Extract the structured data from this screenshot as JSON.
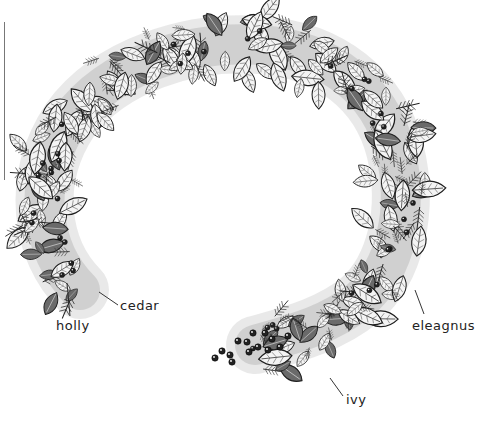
{
  "figure": {
    "style": "pen-and-ink line drawing",
    "stroke_color": "#1e1e1e",
    "background": "#ffffff",
    "labels": [
      {
        "id": "holly",
        "text": "holly",
        "x": 56,
        "y": 322,
        "pointer": {
          "x1": 70,
          "y1": 316,
          "x2": 67,
          "y2": 283
        }
      },
      {
        "id": "cedar",
        "text": "cedar",
        "x": 120,
        "y": 302,
        "pointer": {
          "x1": 118,
          "y1": 305,
          "x2": 99,
          "y2": 292
        }
      },
      {
        "id": "eleagnus",
        "text": "eleagnus",
        "x": 412,
        "y": 321,
        "pointer": {
          "x1": 424,
          "y1": 314,
          "x2": 415,
          "y2": 290
        }
      },
      {
        "id": "ivy",
        "text": "ivy",
        "x": 345,
        "y": 397,
        "pointer": {
          "x1": 343,
          "y1": 396,
          "x2": 330,
          "y2": 378
        }
      }
    ]
  }
}
